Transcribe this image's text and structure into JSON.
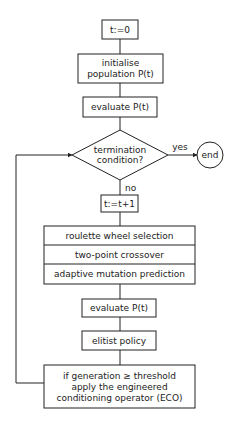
{
  "diagram": {
    "type": "flowchart",
    "nodes": {
      "init_t": {
        "label": "t:=0"
      },
      "init_pop": {
        "lines": [
          "initialise",
          "population P(t)"
        ]
      },
      "eval1": {
        "label": "evaluate P(t)"
      },
      "term": {
        "lines": [
          "termination",
          "condition?"
        ]
      },
      "end": {
        "label": "end"
      },
      "incr": {
        "label": "t:=t+1"
      },
      "ops": {
        "rows": [
          "roulette wheel selection",
          "two-point crossover",
          "adaptive mutation prediction"
        ]
      },
      "eval2": {
        "label": "evaluate P(t)"
      },
      "elitist": {
        "label": "elitist policy"
      },
      "eco": {
        "lines": [
          "if generation ≥ threshold",
          "apply the engineered",
          "conditioning operator (ECO)"
        ]
      }
    },
    "edge_labels": {
      "yes": "yes",
      "no": "no"
    },
    "colors": {
      "stroke": "#222222",
      "background": "#ffffff"
    }
  }
}
